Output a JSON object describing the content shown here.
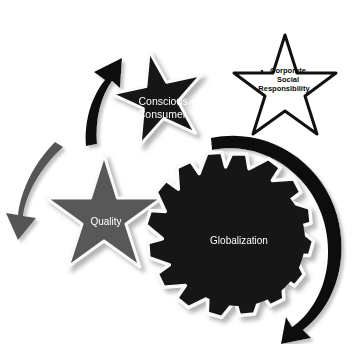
{
  "figure": {
    "background_color": "#ffffff",
    "width": 364,
    "height": 344
  },
  "palette": {
    "black": "#111111",
    "dark_shape": "#141414",
    "gray_shape": "#595959",
    "gray_arrow": "#555555",
    "black_arrow": "#101010",
    "white": "#ffffff",
    "outline": "#f7f7f7",
    "shadow": "#b8b8b8",
    "text_light": "#ffffff",
    "text_dark": "#0a0a0a"
  },
  "shapes": [
    {
      "id": "conscious-consumer-star",
      "kind": "six-point-star",
      "label": "Conscious Consumer",
      "label_lines": [
        "Conscious",
        "Consumer"
      ],
      "fill": "#141414",
      "text_color": "#ffffff",
      "font_size": 11,
      "center": {
        "x": 160,
        "y": 102
      },
      "radius": 52,
      "rotation_deg": -12
    },
    {
      "id": "corporate-social-responsibility-star",
      "kind": "six-point-star",
      "label": "Corporate Social Responsibility",
      "label_lines": [
        "Corporate",
        "Social",
        "Responsibility"
      ],
      "bullet": "•",
      "fill": "#ffffff",
      "stroke": "#111111",
      "text_color": "#0a0a0a",
      "font_size": 7,
      "center": {
        "x": 285,
        "y": 93
      },
      "radius": 58,
      "rotation_deg": 0
    },
    {
      "id": "quality-star",
      "kind": "six-point-star",
      "label": "Quality",
      "label_lines": [
        "Quality"
      ],
      "fill": "#595959",
      "text_color": "#ffffff",
      "font_size": 10,
      "center": {
        "x": 104,
        "y": 221
      },
      "radius": 66,
      "rotation_deg": 0
    },
    {
      "id": "globalization-gear",
      "kind": "gear",
      "label": "Globalization",
      "label_lines": [
        "Globalization"
      ],
      "fill": "#141414",
      "text_color": "#ffffff",
      "font_size": 10,
      "center": {
        "x": 239,
        "y": 241
      },
      "radius": 88,
      "teeth": 12
    }
  ],
  "arrows": [
    {
      "id": "gray-arrow-left",
      "color": "#555555",
      "direction": "counter-clockwise down-left",
      "from": {
        "x": 62,
        "y": 150
      },
      "to": {
        "x": 22,
        "y": 231
      }
    },
    {
      "id": "black-arrow-top",
      "color": "#101010",
      "direction": "clockwise up-right",
      "from": {
        "x": 88,
        "y": 142
      },
      "to": {
        "x": 116,
        "y": 61
      }
    },
    {
      "id": "black-arc-right",
      "color": "#101010",
      "direction": "clockwise sweeping right and down",
      "from": {
        "x": 214,
        "y": 152
      },
      "to": {
        "x": 313,
        "y": 324
      }
    }
  ]
}
